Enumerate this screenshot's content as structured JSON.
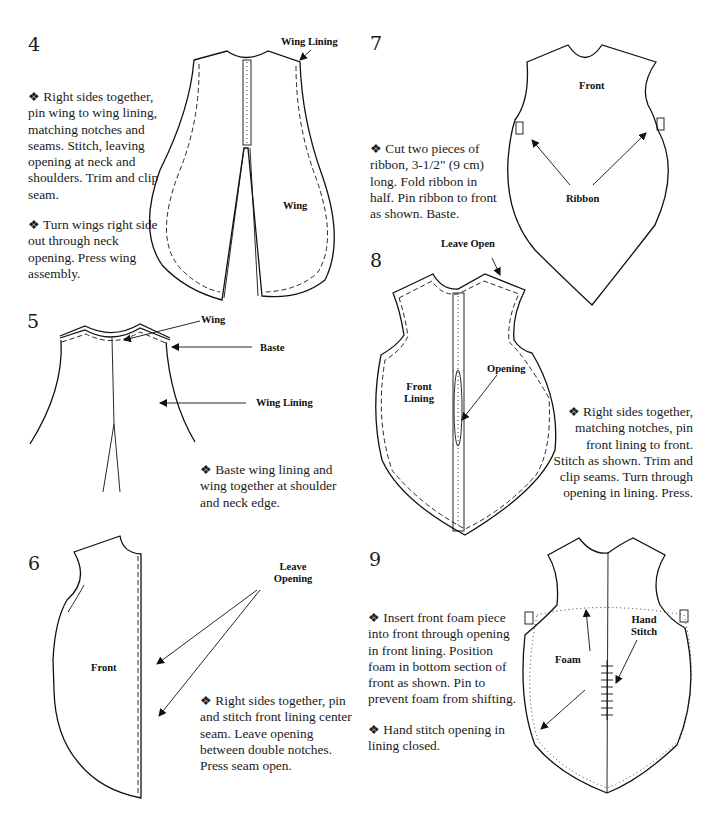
{
  "document": {
    "bullet": "❖",
    "steps": [
      {
        "number": "4",
        "paragraphs": [
          "Right sides together, pin wing to wing lining, matching notches and seams. Stitch, leaving opening at neck and shoulders. Trim and clip seam.",
          "Turn wings right side out through neck opening. Press wing assembly."
        ],
        "labels": {
          "wing_lining": "Wing Lining",
          "wing": "Wing"
        }
      },
      {
        "number": "5",
        "paragraphs": [
          "Baste wing lining and wing together at shoulder and neck edge."
        ],
        "labels": {
          "wing": "Wing",
          "baste": "Baste",
          "wing_lining": "Wing Lining"
        }
      },
      {
        "number": "6",
        "paragraphs": [
          "Right sides together, pin and stitch front lining center seam. Leave opening between double notches. Press seam open."
        ],
        "labels": {
          "leave_opening_1": "Leave",
          "leave_opening_2": "Opening",
          "front": "Front"
        }
      },
      {
        "number": "7",
        "paragraphs": [
          "Cut two pieces of ribbon, 3-1/2\" (9 cm) long. Fold ribbon in half. Pin ribbon to front as shown. Baste."
        ],
        "labels": {
          "front": "Front",
          "ribbon": "Ribbon"
        }
      },
      {
        "number": "8",
        "paragraphs": [
          "Right sides together, matching notches, pin front lining to front. Stitch as shown. Trim and clip seams. Turn through opening in lining. Press."
        ],
        "labels": {
          "leave_open": "Leave Open",
          "opening": "Opening",
          "front_lining_1": "Front",
          "front_lining_2": "Lining"
        }
      },
      {
        "number": "9",
        "paragraphs": [
          "Insert front foam piece into front through opening in front lining. Position foam in bottom section of front as shown. Pin to prevent foam from shifting.",
          "Hand stitch opening in lining closed."
        ],
        "labels": {
          "foam": "Foam",
          "hand_stitch_1": "Hand",
          "hand_stitch_2": "Stitch"
        }
      }
    ]
  }
}
